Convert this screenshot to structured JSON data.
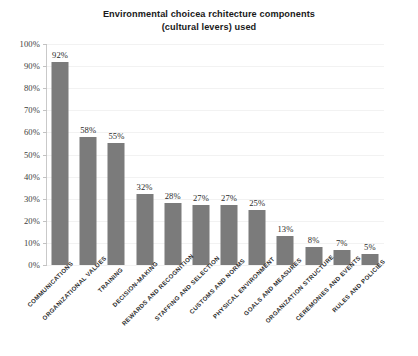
{
  "chart_data": {
    "type": "bar",
    "title": "Environmental choicea rchitecture components (cultural levers) used",
    "title_line1": "Environmental choicea rchitecture components",
    "title_line2": "(cultural levers) used",
    "xlabel": "",
    "ylabel": "",
    "ylim": [
      0,
      100
    ],
    "grid": true,
    "legend": false,
    "bar_color": "#7b7b7b",
    "background_color": "#ffffff",
    "categories": [
      "Communications",
      "Organizational Values",
      "Training",
      "Decision-Making",
      "Rewards and Recognition",
      "Staffing and Selection",
      "Customs and Norms",
      "Physical Environment",
      "Goals and Measures",
      "Organization Structure",
      "Ceremonies and Events",
      "Rules and Policies"
    ],
    "values": [
      92,
      58,
      55,
      32,
      28,
      27,
      27,
      25,
      13,
      8,
      7,
      5
    ],
    "value_labels": [
      "92%",
      "58%",
      "55%",
      "32%",
      "28%",
      "27%",
      "27%",
      "25%",
      "13%",
      "8%",
      "7%",
      "5%"
    ],
    "ytick_values": [
      0,
      10,
      20,
      30,
      40,
      50,
      60,
      70,
      80,
      90,
      100
    ],
    "ytick_labels": [
      "0%",
      "10%",
      "20%",
      "30%",
      "40%",
      "50%",
      "60%",
      "70%",
      "80%",
      "90%",
      "100%"
    ]
  }
}
